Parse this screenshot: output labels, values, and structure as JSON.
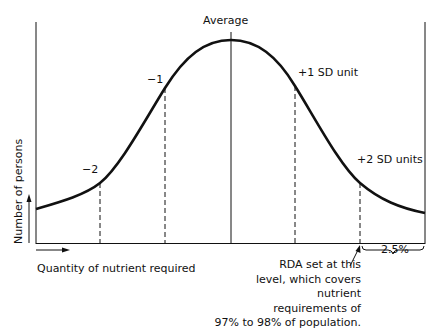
{
  "diagram": {
    "type": "normal-distribution",
    "title": "Average",
    "y_axis_label": "Number of persons",
    "x_axis_label": "Quantity of nutrient required",
    "sd_markers": [
      {
        "label": "−2",
        "position": -2
      },
      {
        "label": "−1",
        "position": -1
      },
      {
        "label": "+1 SD unit",
        "position": 1
      },
      {
        "label": "+2 SD units",
        "position": 2
      }
    ],
    "tail_label": "2.5%",
    "annotation": {
      "lines": [
        "RDA set at this",
        "level, which covers",
        "nutrient",
        "requirements of",
        "97% to 98% of population."
      ]
    },
    "colors": {
      "line": "#111111",
      "background": "#ffffff"
    }
  }
}
